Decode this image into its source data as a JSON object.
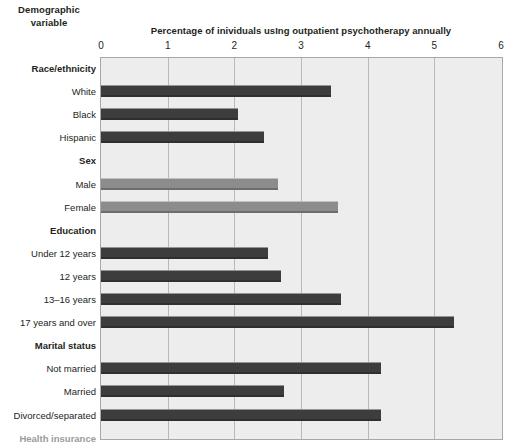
{
  "header": {
    "column_header_line1": "Demographic",
    "column_header_line2": "variable"
  },
  "chart_data": {
    "type": "bar",
    "orientation": "horizontal",
    "title": "Percentage of inividuals usIng outpatient psychotherapy annually",
    "xlabel": "",
    "ylabel": "Demographic variable",
    "xlim": [
      0,
      6
    ],
    "xticks": [
      0,
      1,
      2,
      3,
      4,
      5,
      6
    ],
    "xtick_labels": [
      "0",
      "1",
      "2",
      "3",
      "4",
      "5",
      "6"
    ],
    "grid": true,
    "legend": "none",
    "colors": {
      "dark_bar": "#3d3d3d",
      "light_bar": "#8c8c8c",
      "plot_background": "#ededed",
      "gridline": "#b9b9b9",
      "plot_border": "#a8a8a8",
      "text": "#231f20",
      "muted_text": "#9b9b9b"
    },
    "groups": [
      {
        "name": "Race/ethnicity",
        "muted": false,
        "shade": "dark",
        "categories": [
          "White",
          "Black",
          "Hispanic"
        ],
        "values": [
          3.45,
          2.05,
          2.45
        ]
      },
      {
        "name": "Sex",
        "muted": false,
        "shade": "light",
        "categories": [
          "Male",
          "Female"
        ],
        "values": [
          2.65,
          3.55
        ]
      },
      {
        "name": "Education",
        "muted": false,
        "shade": "dark",
        "categories": [
          "Under 12 years",
          "12 years",
          "13–16 years",
          "17 years and over"
        ],
        "values": [
          2.5,
          2.7,
          3.6,
          5.3
        ]
      },
      {
        "name": "Marital status",
        "muted": false,
        "shade": "dark",
        "categories": [
          "Not married",
          "Married",
          "Divorced/separated"
        ],
        "values": [
          4.2,
          2.75,
          4.2
        ]
      },
      {
        "name": "Health insurance",
        "muted": true,
        "shade": "light",
        "categories": [
          "Public",
          "Private",
          "None"
        ],
        "values": [
          4.1,
          3.0,
          1.75
        ]
      }
    ]
  }
}
